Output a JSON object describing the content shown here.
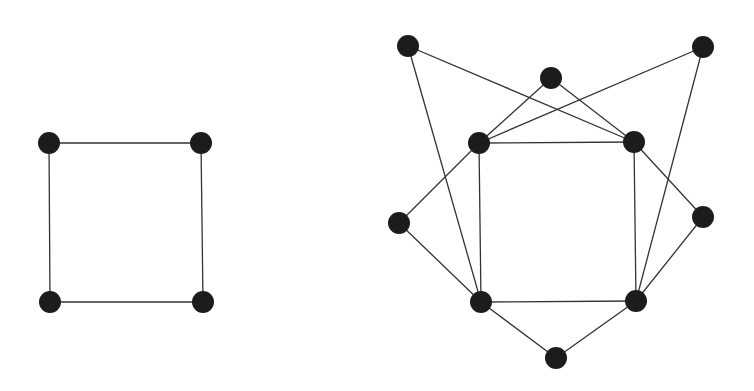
{
  "graphs": [
    {
      "name": "cycle-4",
      "nodes": [
        {
          "id": "a1",
          "x": 49,
          "y": 143
        },
        {
          "id": "a2",
          "x": 201,
          "y": 143
        },
        {
          "id": "a3",
          "x": 203,
          "y": 302
        },
        {
          "id": "a4",
          "x": 50,
          "y": 302
        }
      ],
      "edges": [
        [
          "a1",
          "a2"
        ],
        [
          "a2",
          "a3"
        ],
        [
          "a3",
          "a4"
        ],
        [
          "a4",
          "a1"
        ]
      ]
    },
    {
      "name": "extended-graph",
      "nodes": [
        {
          "id": "b_tl",
          "x": 408,
          "y": 46
        },
        {
          "id": "b_tm",
          "x": 551,
          "y": 78
        },
        {
          "id": "b_tr",
          "x": 703,
          "y": 47
        },
        {
          "id": "b_l",
          "x": 399,
          "y": 223
        },
        {
          "id": "b_r",
          "x": 703,
          "y": 217
        },
        {
          "id": "b_b",
          "x": 556,
          "y": 358
        },
        {
          "id": "s_tl",
          "x": 479,
          "y": 143
        },
        {
          "id": "s_tr",
          "x": 634,
          "y": 142
        },
        {
          "id": "s_br",
          "x": 636,
          "y": 301
        },
        {
          "id": "s_bl",
          "x": 481,
          "y": 302
        }
      ],
      "edges": [
        [
          "s_tl",
          "s_tr"
        ],
        [
          "s_tr",
          "s_br"
        ],
        [
          "s_br",
          "s_bl"
        ],
        [
          "s_bl",
          "s_tl"
        ],
        [
          "b_tl",
          "s_tr"
        ],
        [
          "b_tl",
          "s_bl"
        ],
        [
          "b_tm",
          "s_tl"
        ],
        [
          "b_tm",
          "s_tr"
        ],
        [
          "b_tr",
          "s_tl"
        ],
        [
          "b_tr",
          "s_br"
        ],
        [
          "b_l",
          "s_tl"
        ],
        [
          "b_l",
          "s_bl"
        ],
        [
          "b_r",
          "s_tr"
        ],
        [
          "b_r",
          "s_br"
        ],
        [
          "b_b",
          "s_bl"
        ],
        [
          "b_b",
          "s_br"
        ]
      ]
    }
  ],
  "style": {
    "node_color": "#1c1c1c",
    "edge_color": "#333333",
    "node_radius": 11
  }
}
